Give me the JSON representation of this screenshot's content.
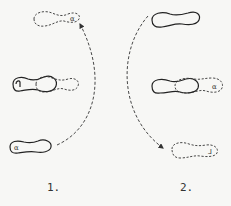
{
  "figure": {
    "panels": [
      {
        "label": "1.",
        "footprints": [
          {
            "position": "top",
            "style": "dashed",
            "mark": "α"
          },
          {
            "position": "middle",
            "style": "solid+dashed overlap",
            "mark": ""
          },
          {
            "position": "bottom",
            "style": "solid",
            "mark": "α"
          }
        ],
        "arrow": "dashed arc from bottom foot up to top foot"
      },
      {
        "label": "2.",
        "footprints": [
          {
            "position": "top",
            "style": "solid",
            "mark": ""
          },
          {
            "position": "middle",
            "style": "solid+dashed overlap",
            "mark": "α"
          },
          {
            "position": "bottom",
            "style": "dashed",
            "mark": "⅃"
          }
        ],
        "arrow": "dashed arc from top foot down to bottom foot"
      }
    ]
  }
}
